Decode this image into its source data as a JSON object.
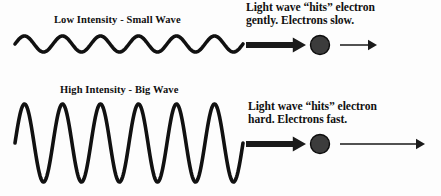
{
  "figure": {
    "background_color": "#fdfdfd",
    "ink_color": "#111111",
    "electron_color": "#3c3c3c"
  },
  "panels": [
    {
      "id": "low-intensity",
      "wave_label": "Low Intensity - Small Wave",
      "caption": "Light wave “hits” electron\ngently.  Electrons slow.",
      "wave": {
        "cycles": 6,
        "amplitude_px": 8,
        "baseline_y": 44,
        "start_x": 15,
        "end_x": 243,
        "stroke_width": 3.6
      },
      "incoming_arrow": {
        "label": "thick-light-arrow",
        "x1": 246,
        "x2": 306,
        "y": 45,
        "thickness": 6
      },
      "electron": {
        "cx": 320,
        "cy": 45,
        "r": 9.5
      },
      "recoil_arrow": {
        "label": "thin-electron-arrow",
        "x1": 340,
        "x2": 377,
        "y": 45,
        "thickness": 1.7
      }
    },
    {
      "id": "high-intensity",
      "wave_label": "High Intensity - Big Wave",
      "caption": "Light wave “hits” electron\nhard.  Electrons fast.",
      "wave": {
        "cycles": 6,
        "amplitude_px": 39,
        "baseline_y": 143,
        "start_x": 15,
        "end_x": 243,
        "stroke_width": 3.6
      },
      "incoming_arrow": {
        "label": "thick-light-arrow",
        "x1": 246,
        "x2": 306,
        "y": 144,
        "thickness": 6
      },
      "electron": {
        "cx": 320,
        "cy": 144,
        "r": 9.5
      },
      "recoil_arrow": {
        "label": "thin-electron-arrow",
        "x1": 340,
        "x2": 425,
        "y": 144,
        "thickness": 1.7
      }
    }
  ],
  "label_positions": {
    "low_wave_label": {
      "x": 54,
      "y": 14
    },
    "low_caption": {
      "x": 246,
      "y": 1
    },
    "high_wave_label": {
      "x": 60,
      "y": 84
    },
    "high_caption": {
      "x": 248,
      "y": 100
    }
  }
}
